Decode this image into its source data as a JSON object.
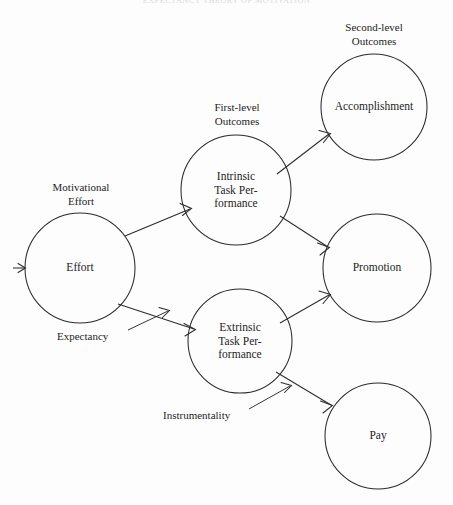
{
  "page": {
    "running_head": "EXPECTANCY THEORY OF MOTIVATION",
    "background_color": "#fdfdfd",
    "ink_color": "#2b2b2b"
  },
  "diagram": {
    "type": "expectancy-theory-path-diagram",
    "group_labels": [
      {
        "id": "motivational-effort",
        "text": "Motivational\nEffort"
      },
      {
        "id": "first-level-outcomes",
        "text": "First-level\nOutcomes"
      },
      {
        "id": "second-level-outcomes",
        "text": "Second-level\nOutcomes"
      }
    ],
    "nodes": [
      {
        "id": "effort",
        "label": "Effort",
        "cx": 80,
        "cy": 268,
        "r": 55
      },
      {
        "id": "intrinsic",
        "label": "Intrinsic\nTask Per-\nformance",
        "cx": 236,
        "cy": 190,
        "r": 55
      },
      {
        "id": "extrinsic",
        "label": "Extrinsic\nTask Per-\nformance",
        "cx": 240,
        "cy": 341,
        "r": 52
      },
      {
        "id": "accomplishment",
        "label": "Accomplishment",
        "cx": 374,
        "cy": 107,
        "r": 53
      },
      {
        "id": "promotion",
        "label": "Promotion",
        "cx": 377,
        "cy": 268,
        "r": 54
      },
      {
        "id": "pay",
        "label": "Pay",
        "cx": 378,
        "cy": 436,
        "r": 53
      }
    ],
    "edges": [
      {
        "id": "input-to-effort",
        "from": "",
        "to": "effort"
      },
      {
        "id": "effort-to-intrinsic",
        "from": "effort",
        "to": "intrinsic"
      },
      {
        "id": "effort-to-extrinsic",
        "from": "effort",
        "to": "extrinsic"
      },
      {
        "id": "intrinsic-to-accomplishment",
        "from": "intrinsic",
        "to": "accomplishment"
      },
      {
        "id": "intrinsic-to-promotion",
        "from": "intrinsic",
        "to": "promotion"
      },
      {
        "id": "extrinsic-to-promotion",
        "from": "extrinsic",
        "to": "promotion"
      },
      {
        "id": "extrinsic-to-pay",
        "from": "extrinsic",
        "to": "pay"
      }
    ],
    "edge_labels": [
      {
        "id": "expectancy",
        "text": "Expectancy"
      },
      {
        "id": "instrumentality",
        "text": "Instrumentality"
      }
    ]
  }
}
